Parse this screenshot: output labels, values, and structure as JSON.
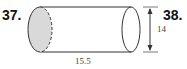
{
  "problems": [
    {
      "number": "37."
    },
    {
      "number": "38."
    }
  ],
  "figure": {
    "shape": "cylinder",
    "length_label": "15.5",
    "diameter_label": "14",
    "colors": {
      "stroke": "#333333",
      "shaded_face": "#d9d9d9",
      "dim_text": "#444444"
    }
  }
}
